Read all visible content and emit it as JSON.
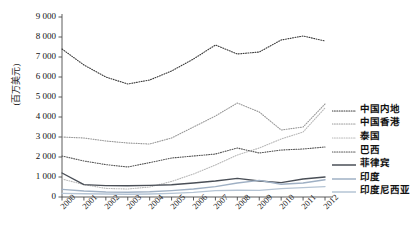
{
  "chart_data": {
    "type": "line",
    "title": "",
    "xlabel": "",
    "ylabel": "(百万美元)",
    "ylim": [
      0,
      9000
    ],
    "ytick_labels": [
      "0",
      "1 000",
      "2 000",
      "3 000",
      "4 000",
      "5 000",
      "6 000",
      "7 000",
      "8 000",
      "9 000"
    ],
    "ytick_values": [
      0,
      1000,
      2000,
      3000,
      4000,
      5000,
      6000,
      7000,
      8000,
      9000
    ],
    "grid": false,
    "legend_position": "right",
    "categories": [
      "2000",
      "2001",
      "2002",
      "2003",
      "2004",
      "2005",
      "2006",
      "2007",
      "2008",
      "2009",
      "2010",
      "2011",
      "2012"
    ],
    "x": [
      2000,
      2001,
      2002,
      2003,
      2004,
      2005,
      2006,
      2007,
      2008,
      2009,
      2010,
      2011,
      2012
    ],
    "series": [
      {
        "name": "中国内地",
        "color": "#3a3a3a",
        "style": "dotted",
        "width": 1.1,
        "values": [
          7400,
          6600,
          6000,
          5650,
          5850,
          6300,
          6900,
          7600,
          7150,
          7250,
          7850,
          8050,
          7800
        ]
      },
      {
        "name": "中国香港",
        "color": "#9a9a9a",
        "style": "dotted",
        "width": 1.1,
        "values": [
          3000,
          2950,
          2800,
          2700,
          2650,
          2950,
          3500,
          4050,
          4700,
          4250,
          3350,
          3500,
          4650
        ]
      },
      {
        "name": "泰国",
        "color": "#b8b8b8",
        "style": "dotted",
        "width": 1.1,
        "values": [
          900,
          620,
          430,
          400,
          500,
          780,
          1150,
          1600,
          2100,
          2450,
          2900,
          3250,
          4450
        ]
      },
      {
        "name": "巴西",
        "color": "#555555",
        "style": "dotted",
        "width": 1.1,
        "values": [
          2050,
          1800,
          1620,
          1500,
          1720,
          1950,
          2050,
          2150,
          2450,
          2200,
          2350,
          2400,
          2500
        ]
      },
      {
        "name": "菲律宾",
        "color": "#4a4f57",
        "style": "solid",
        "width": 1.4,
        "values": [
          1200,
          620,
          570,
          560,
          580,
          610,
          700,
          800,
          930,
          800,
          720,
          900,
          1000
        ]
      },
      {
        "name": "印度",
        "color": "#9fb0c4",
        "style": "solid",
        "width": 1.4,
        "values": [
          380,
          300,
          250,
          240,
          260,
          320,
          400,
          520,
          700,
          830,
          640,
          700,
          860
        ]
      },
      {
        "name": "印度尼西亚",
        "color": "#b5c4d4",
        "style": "solid",
        "width": 1.4,
        "values": [
          180,
          160,
          150,
          140,
          150,
          180,
          230,
          320,
          340,
          330,
          420,
          470,
          520
        ]
      }
    ]
  }
}
